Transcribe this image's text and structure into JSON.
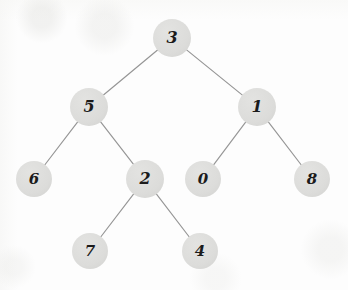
{
  "diagram": {
    "type": "binary-tree",
    "style": {
      "background_color": "#fdfdfd",
      "node_fill_color": "#dcdcda",
      "node_text_color": "#1b1b1b",
      "edge_color": "#8d8d8d"
    },
    "nodes": [
      {
        "id": "n3",
        "label": "3",
        "x": 172,
        "y": 38,
        "r": 19,
        "level": 0,
        "role": "root"
      },
      {
        "id": "n5",
        "label": "5",
        "x": 89,
        "y": 107,
        "r": 19,
        "level": 1,
        "role": "internal"
      },
      {
        "id": "n1",
        "label": "1",
        "x": 257,
        "y": 107,
        "r": 19,
        "level": 1,
        "role": "internal"
      },
      {
        "id": "n6",
        "label": "6",
        "x": 34,
        "y": 179,
        "r": 18,
        "level": 2,
        "role": "leaf"
      },
      {
        "id": "n2",
        "label": "2",
        "x": 145,
        "y": 179,
        "r": 19,
        "level": 2,
        "role": "internal"
      },
      {
        "id": "n0",
        "label": "0",
        "x": 203,
        "y": 179,
        "r": 18,
        "level": 2,
        "role": "leaf"
      },
      {
        "id": "n8",
        "label": "8",
        "x": 312,
        "y": 179,
        "r": 18,
        "level": 2,
        "role": "leaf"
      },
      {
        "id": "n7",
        "label": "7",
        "x": 90,
        "y": 251,
        "r": 18,
        "level": 3,
        "role": "leaf"
      },
      {
        "id": "n4",
        "label": "4",
        "x": 200,
        "y": 251,
        "r": 18,
        "level": 3,
        "role": "leaf"
      }
    ],
    "edges": [
      {
        "id": "e-3-5",
        "from": "n3",
        "to": "n5",
        "side": "left"
      },
      {
        "id": "e-3-1",
        "from": "n3",
        "to": "n1",
        "side": "right"
      },
      {
        "id": "e-5-6",
        "from": "n5",
        "to": "n6",
        "side": "left"
      },
      {
        "id": "e-5-2",
        "from": "n5",
        "to": "n2",
        "side": "right"
      },
      {
        "id": "e-1-0",
        "from": "n1",
        "to": "n0",
        "side": "left"
      },
      {
        "id": "e-1-8",
        "from": "n1",
        "to": "n8",
        "side": "right"
      },
      {
        "id": "e-2-7",
        "from": "n2",
        "to": "n7",
        "side": "left"
      },
      {
        "id": "e-2-4",
        "from": "n2",
        "to": "n4",
        "side": "right"
      }
    ]
  }
}
